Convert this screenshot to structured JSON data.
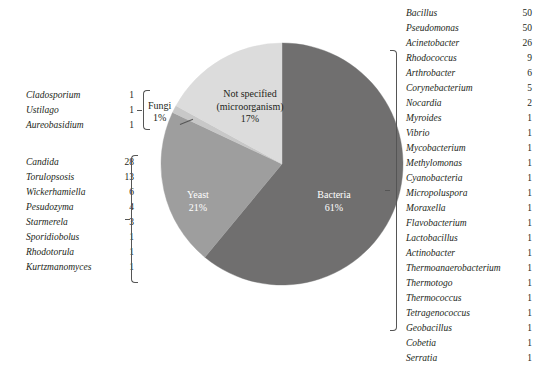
{
  "chart_data": {
    "type": "pie",
    "title": "",
    "categories": [
      "Bacteria",
      "Not specified (microorganism)",
      "Yeast",
      "Fungi"
    ],
    "values": [
      61,
      17,
      21,
      1
    ],
    "labels": [
      "Bacteria\n61%",
      "Not specified\n(microorganism)\n17%",
      "Yeast\n21%",
      "Fungi\n1%"
    ],
    "colors": [
      "#706f6f",
      "#dcdcdc",
      "#9e9e9e",
      "#c8c8c8"
    ],
    "legend": "none",
    "annotations": [
      "Fungi genera bracket (left-top)",
      "Yeast genera bracket (left-bottom)",
      "Bacteria genera bracket (right)"
    ]
  },
  "colors": {
    "bacteria": "#706f6f",
    "yeast": "#9e9e9e",
    "not_specified": "#dcdcdc",
    "fungi": "#c8c8c8",
    "background": "#ffffff",
    "text": "#231f20",
    "bracket": "#555555"
  },
  "pie": {
    "slices": [
      {
        "name": "Bacteria",
        "percent_label": "61%",
        "label_line1": "Bacteria",
        "label_line2": "61%",
        "value": 61,
        "color": "#706f6f"
      },
      {
        "name": "Not specified (microorganism)",
        "percent_label": "17%",
        "label_line1": "Not specified",
        "label_line2": "(microorganism)",
        "label_line3": "17%",
        "value": 17,
        "color": "#dcdcdc"
      },
      {
        "name": "Yeast",
        "percent_label": "21%",
        "label_line1": "Yeast",
        "label_line2": "21%",
        "value": 21,
        "color": "#9e9e9e"
      },
      {
        "name": "Fungi",
        "percent_label": "1%",
        "label_line1": "Fungi",
        "label_line2": "1%",
        "value": 1,
        "color": "#c8c8c8"
      }
    ]
  },
  "groups": {
    "fungi": {
      "label_line1": "Fungi",
      "label_line2": "1%",
      "items": [
        {
          "genus": "Cladosporium",
          "count": "1"
        },
        {
          "genus": "Ustilago",
          "count": "1"
        },
        {
          "genus": "Aureobasidium",
          "count": "1"
        }
      ]
    },
    "yeast": {
      "label": "Yeast",
      "items": [
        {
          "genus": "Candida",
          "count": "28"
        },
        {
          "genus": "Torulopsosis",
          "count": "13"
        },
        {
          "genus": "Wickerhamiella",
          "count": "6"
        },
        {
          "genus": "Pesudozyma",
          "count": "4"
        },
        {
          "genus": "Starmerela",
          "count": "3"
        },
        {
          "genus": "Sporidiobolus",
          "count": "1"
        },
        {
          "genus": "Rhodotorula",
          "count": "1"
        },
        {
          "genus": "Kurtzmanomyces",
          "count": "1"
        }
      ]
    },
    "bacteria": {
      "label": "Bacteria",
      "items": [
        {
          "genus": "Bacillus",
          "count": "50"
        },
        {
          "genus": "Pseudomonas",
          "count": "50"
        },
        {
          "genus": "Acinetobacter",
          "count": "26"
        },
        {
          "genus": "Rhodococcus",
          "count": "9"
        },
        {
          "genus": "Arthrobacter",
          "count": "6"
        },
        {
          "genus": "Corynebacterium",
          "count": "5"
        },
        {
          "genus": "Nocardia",
          "count": "2"
        },
        {
          "genus": "Myroides",
          "count": "1"
        },
        {
          "genus": "Vibrio",
          "count": "1"
        },
        {
          "genus": "Mycobacterium",
          "count": "1"
        },
        {
          "genus": "Methylomonas",
          "count": "1"
        },
        {
          "genus": "Cyanobacteria",
          "count": "1"
        },
        {
          "genus": "Micropoluspora",
          "count": "1"
        },
        {
          "genus": "Moraxella",
          "count": "1"
        },
        {
          "genus": "Flavobacterium",
          "count": "1"
        },
        {
          "genus": "Lactobacillus",
          "count": "1"
        },
        {
          "genus": "Actinobacter",
          "count": "1"
        },
        {
          "genus": "Thermoanaerobacterium",
          "count": "1"
        },
        {
          "genus": "Thermotogo",
          "count": "1"
        },
        {
          "genus": "Thermococcus",
          "count": "1"
        },
        {
          "genus": "Tetragenococcus",
          "count": "1"
        },
        {
          "genus": "Geobacillus",
          "count": "1"
        },
        {
          "genus": "Cobetia",
          "count": "1"
        },
        {
          "genus": "Serratia",
          "count": "1"
        }
      ]
    }
  }
}
